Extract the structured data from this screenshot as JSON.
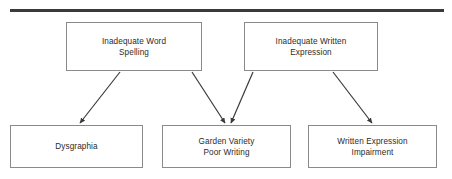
{
  "diagram": {
    "title_rule": {
      "name": "top-horizontal-rule",
      "color": "#3a3a3a"
    },
    "theme": {
      "background": "#ffffff",
      "box_fill": "#ffffff",
      "box_border": "#8a8a8a",
      "text_color": "#2b2b2b",
      "arrow_color": "#3a3a3a"
    },
    "nodes": [
      {
        "id": "inadequate-word-spelling",
        "label": "Inadequate Word\nSpelling",
        "x": 66,
        "y": 22,
        "width": 136,
        "height": 49,
        "row": "top"
      },
      {
        "id": "inadequate-written-expression",
        "label": "Inadequate Written\nExpression",
        "x": 244,
        "y": 22,
        "width": 134,
        "height": 49,
        "row": "top"
      },
      {
        "id": "dysgraphia",
        "label": "Dysgraphia",
        "x": 10,
        "y": 125,
        "width": 133,
        "height": 43,
        "row": "bottom"
      },
      {
        "id": "garden-variety-poor-writing",
        "label": "Garden Variety\nPoor Writing",
        "x": 162,
        "y": 125,
        "width": 129,
        "height": 43,
        "row": "bottom"
      },
      {
        "id": "written-expression-impairment",
        "label": "Written Expression\nImpairment",
        "x": 308,
        "y": 125,
        "width": 129,
        "height": 43,
        "row": "bottom"
      }
    ],
    "edges": [
      {
        "id": "edge-spelling-to-dysgraphia",
        "from": "inadequate-word-spelling",
        "to": "dysgraphia",
        "x1": 120,
        "y1": 72,
        "x2": 80,
        "y2": 123
      },
      {
        "id": "edge-spelling-to-garden-variety",
        "from": "inadequate-word-spelling",
        "to": "garden-variety-poor-writing",
        "x1": 192,
        "y1": 72,
        "x2": 225,
        "y2": 123
      },
      {
        "id": "edge-written-to-garden-variety",
        "from": "inadequate-written-expression",
        "to": "garden-variety-poor-writing",
        "x1": 253,
        "y1": 72,
        "x2": 231,
        "y2": 123
      },
      {
        "id": "edge-written-to-impairment",
        "from": "inadequate-written-expression",
        "to": "written-expression-impairment",
        "x1": 333,
        "y1": 72,
        "x2": 372,
        "y2": 123
      }
    ]
  }
}
